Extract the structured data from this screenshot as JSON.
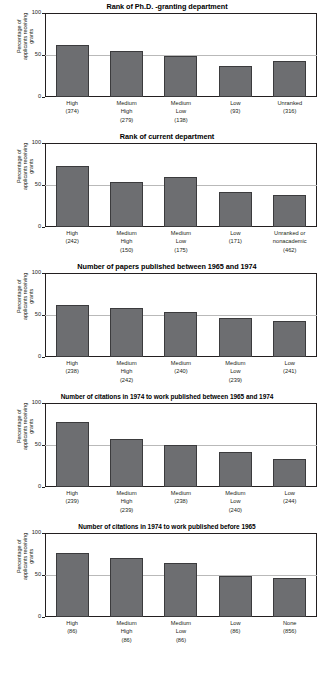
{
  "figure": {
    "y_axis_title": "Percentage of applicants receiving grants",
    "y_ticks": [
      "100",
      "50",
      "0"
    ],
    "bar_color": "#6d6e71",
    "axis_color": "#231f20",
    "gridline_color": "#b9b9b9"
  },
  "chart_data": [
    {
      "type": "bar",
      "title": "Rank of Ph.D. -granting department",
      "xlabel": "",
      "ylabel": "Percentage of applicants receiving grants",
      "ylim": [
        0,
        100
      ],
      "yticks": [
        0,
        50,
        100
      ],
      "grid": true,
      "categories": [
        "High",
        "Medium High",
        "Medium Low",
        "Low",
        "Unranked"
      ],
      "category_lines": [
        [
          "High",
          "(374)"
        ],
        [
          "Medium",
          "High",
          "(279)"
        ],
        [
          "Medium",
          "Low",
          "(138)"
        ],
        [
          "Low",
          "(93)"
        ],
        [
          "Unranked",
          "(316)"
        ]
      ],
      "counts": [
        374,
        279,
        138,
        93,
        316
      ],
      "values": [
        62,
        55,
        49,
        37,
        43
      ]
    },
    {
      "type": "bar",
      "title": "Rank of current department",
      "xlabel": "",
      "ylabel": "Percentage of applicants receiving grants",
      "ylim": [
        0,
        100
      ],
      "yticks": [
        0,
        50,
        100
      ],
      "grid": true,
      "categories": [
        "High",
        "Medium High",
        "Medium Low",
        "Low",
        "Unranked or nonacademic"
      ],
      "category_lines": [
        [
          "High",
          "(242)"
        ],
        [
          "Medium",
          "High",
          "(150)"
        ],
        [
          "Medium",
          "Low",
          "(175)"
        ],
        [
          "Low",
          "(171)"
        ],
        [
          "Unranked or",
          "nonacademic",
          "(462)"
        ]
      ],
      "counts": [
        242,
        150,
        175,
        171,
        462
      ],
      "values": [
        73,
        54,
        60,
        42,
        38
      ]
    },
    {
      "type": "bar",
      "title": "Number of papers published between 1965 and 1974",
      "xlabel": "",
      "ylabel": "Percentage of applicants receiving grants",
      "ylim": [
        0,
        100
      ],
      "yticks": [
        0,
        50,
        100
      ],
      "grid": true,
      "categories": [
        "High",
        "Medium High",
        "Medium",
        "Medium Low",
        "Low"
      ],
      "category_lines": [
        [
          "High",
          "(238)"
        ],
        [
          "Medium",
          "High",
          "(242)"
        ],
        [
          "Medium",
          "(240)"
        ],
        [
          "Medium",
          "Low",
          "(239)"
        ],
        [
          "Low",
          "(241)"
        ]
      ],
      "counts": [
        238,
        242,
        240,
        239,
        241
      ],
      "values": [
        62,
        58,
        54,
        46,
        43
      ]
    },
    {
      "type": "bar",
      "title": "Number of citations in 1974 to work published between 1965 and 1974",
      "xlabel": "",
      "ylabel": "Percentage of applicants receiving grants",
      "ylim": [
        0,
        100
      ],
      "yticks": [
        0,
        50,
        100
      ],
      "grid": true,
      "categories": [
        "High",
        "Medium High",
        "Medium",
        "Medium Low",
        "Low"
      ],
      "category_lines": [
        [
          "High",
          "(239)"
        ],
        [
          "Medium",
          "High",
          "(239)"
        ],
        [
          "Medium",
          "(238)"
        ],
        [
          "Medium",
          "Low",
          "(240)"
        ],
        [
          "Low",
          "(244)"
        ]
      ],
      "counts": [
        239,
        239,
        238,
        240,
        244
      ],
      "values": [
        77,
        57,
        50,
        42,
        33
      ]
    },
    {
      "type": "bar",
      "title": "Number of citations in 1974 to work published before 1965",
      "xlabel": "",
      "ylabel": "Percentage of applicants receiving grants",
      "ylim": [
        0,
        100
      ],
      "yticks": [
        0,
        50,
        100
      ],
      "grid": true,
      "categories": [
        "High",
        "Medium High",
        "Medium Low",
        "Low",
        "None"
      ],
      "category_lines": [
        [
          "High",
          "(86)"
        ],
        [
          "Medium",
          "High",
          "(86)"
        ],
        [
          "Medium",
          "Low",
          "(86)"
        ],
        [
          "Low",
          "(86)"
        ],
        [
          "None",
          "(856)"
        ]
      ],
      "counts": [
        86,
        86,
        86,
        86,
        856
      ],
      "values": [
        76,
        70,
        64,
        49,
        47
      ]
    }
  ]
}
